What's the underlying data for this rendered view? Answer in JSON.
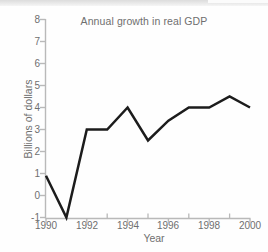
{
  "chart_data": {
    "type": "line",
    "title": "Annual growth in real GDP",
    "xlabel": "Year",
    "ylabel": "Billions of dollars",
    "x": [
      1990,
      1991,
      1992,
      1993,
      1994,
      1995,
      1996,
      1997,
      1998,
      1999,
      2000
    ],
    "values": [
      0.9,
      -1.0,
      3.0,
      3.0,
      4.0,
      2.5,
      3.4,
      4.0,
      4.0,
      4.5,
      4.0
    ],
    "series": [
      {
        "name": "Annual growth in real GDP",
        "values": [
          0.9,
          -1.0,
          3.0,
          3.0,
          4.0,
          2.5,
          3.4,
          4.0,
          4.0,
          4.5,
          4.0
        ]
      }
    ],
    "xlim": [
      1990,
      2000
    ],
    "ylim": [
      -1,
      8
    ],
    "y_ticks": [
      8,
      7,
      6,
      5,
      4,
      3,
      2,
      1,
      0,
      -1
    ],
    "y_tick_labels": [
      "8",
      "7",
      "6",
      "5",
      "4",
      "3",
      "2",
      "1",
      "0",
      "-1"
    ],
    "x_ticks": [
      1990,
      1992,
      1994,
      1996,
      1998,
      2000
    ],
    "x_tick_labels": [
      "1990",
      "1992",
      "1994",
      "1996",
      "1998",
      "2000"
    ],
    "x_minor_ticks": [
      1991,
      1993,
      1995,
      1997,
      1999
    ],
    "grid": false,
    "legend": null,
    "legend_position": "none",
    "annotations": []
  },
  "axis": {
    "y_labels": [
      "8",
      "7",
      "6",
      "5",
      "4",
      "3",
      "2",
      "1",
      "0",
      "-1"
    ],
    "x_labels": [
      "1990",
      "1992",
      "1994",
      "1996",
      "1998",
      "2000"
    ]
  },
  "colors": {
    "line": "#1c1c1c",
    "axis": "#b9b9b9",
    "text": "#6f6f6f",
    "background": "#fefefe"
  }
}
